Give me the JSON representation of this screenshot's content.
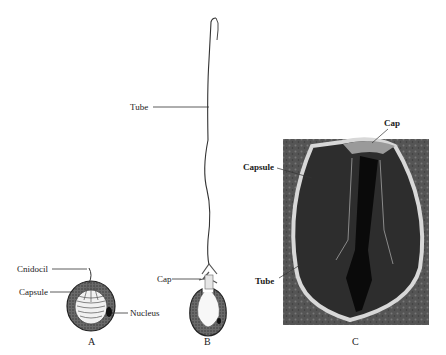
{
  "figure": {
    "panels": [
      {
        "id": "A",
        "label": "A",
        "labels": [
          "Cnidocil",
          "Capsule",
          "Nucleus"
        ]
      },
      {
        "id": "B",
        "label": "B",
        "labels": [
          "Tube",
          "Cap"
        ]
      },
      {
        "id": "C",
        "label": "C",
        "labels": [
          "Cap",
          "Capsule",
          "Tube"
        ]
      }
    ]
  },
  "panelA": {
    "cnidocil": "Cnidocil",
    "capsule": "Capsule",
    "nucleus": "Nucleus",
    "letter": "A"
  },
  "panelB": {
    "tube": "Tube",
    "cap": "Cap",
    "letter": "B"
  },
  "panelC": {
    "cap": "Cap",
    "capsule": "Capsule",
    "tube": "Tube",
    "letter": "C"
  }
}
